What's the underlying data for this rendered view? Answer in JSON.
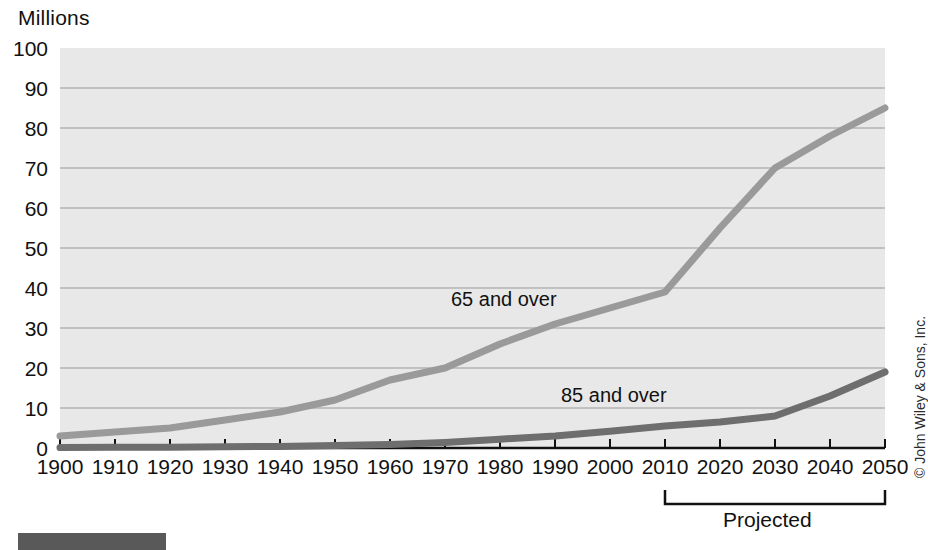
{
  "figure": {
    "axis_title": "Millions",
    "credit": "© John Wiley & Sons, Inc.",
    "projected_label": "Projected",
    "series_label_65": "65 and over",
    "series_label_85": "85 and over"
  },
  "colors": {
    "plot_background": "#e8e8e8",
    "gridline": "#9a9a9a",
    "axis": "#111111",
    "series_65": "#9a9a9a",
    "series_85": "#6e6e6e",
    "text": "#111111",
    "footer_swatch": "#595959"
  },
  "chart_data": {
    "type": "line",
    "title": "",
    "subtitle": "",
    "xlabel": "",
    "ylabel": "Millions",
    "xlim": [
      1900,
      2050
    ],
    "ylim": [
      0,
      100
    ],
    "ytick_step": 10,
    "grid": true,
    "legend": "inline-annotations",
    "x": [
      1900,
      1910,
      1920,
      1930,
      1940,
      1950,
      1960,
      1970,
      1980,
      1990,
      2000,
      2010,
      2020,
      2030,
      2040,
      2050
    ],
    "xticks": [
      "1900",
      "1910",
      "1920",
      "1930",
      "1940",
      "1950",
      "1960",
      "1970",
      "1980",
      "1990",
      "2000",
      "2010",
      "2020",
      "2030",
      "2040",
      "2050"
    ],
    "yticks": [
      "0",
      "10",
      "20",
      "30",
      "40",
      "50",
      "60",
      "70",
      "80",
      "90",
      "100"
    ],
    "series": [
      {
        "name": "65 and over",
        "color": "#9a9a9a",
        "values": [
          3,
          4,
          5,
          7,
          9,
          12,
          17,
          20,
          26,
          31,
          35,
          39,
          55,
          70,
          78,
          85
        ]
      },
      {
        "name": "85 and over",
        "color": "#6e6e6e",
        "values": [
          0.1,
          0.2,
          0.2,
          0.3,
          0.4,
          0.6,
          0.9,
          1.4,
          2.2,
          3.0,
          4.2,
          5.5,
          6.5,
          8.0,
          13.0,
          19.0
        ]
      }
    ],
    "annotations": [
      {
        "text": "65 and over",
        "x": 1982,
        "y": 37
      },
      {
        "text": "85 and over",
        "x": 2002,
        "y": 13
      },
      {
        "text": "Projected",
        "x": 2030,
        "y": -16,
        "bracket_from": 2010,
        "bracket_to": 2050
      }
    ]
  }
}
